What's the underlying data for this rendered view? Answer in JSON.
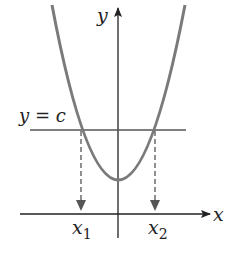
{
  "diagram": {
    "type": "parabola-horizontal-line-test",
    "axes": {
      "x_label": "x",
      "y_label": "y"
    },
    "line_label": "y = c",
    "points": [
      {
        "var": "x",
        "sub": "1"
      },
      {
        "var": "x",
        "sub": "2"
      }
    ],
    "colors": {
      "curve": "#7a7a7a",
      "axes": "#222222",
      "line": "#555555",
      "dashed": "#555555"
    }
  }
}
